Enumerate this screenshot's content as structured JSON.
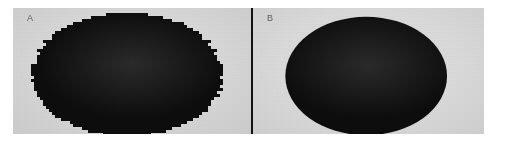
{
  "figure": {
    "background_color": "#ffffff",
    "plate_color": "#d9d9d9",
    "divider_color": "#111111",
    "blob_color": "#0d0d0d"
  },
  "panels": [
    {
      "label": "A",
      "label_color": "#5d5d5d",
      "shape": "ellipse",
      "edge_quality": "jagged",
      "fill_color": "#0d0d0d",
      "background_color": "#d7d7d7",
      "center_x_pct": 48,
      "center_y_pct": 53,
      "radius_x_pct": 40,
      "radius_y_pct": 49
    },
    {
      "label": "B",
      "label_color": "#5d5d5d",
      "shape": "ellipse",
      "edge_quality": "smooth",
      "fill_color": "#0d0d0d",
      "background_color": "#dadada",
      "center_x_pct": 49,
      "center_y_pct": 54,
      "radius_x_pct": 35,
      "radius_y_pct": 47
    }
  ]
}
